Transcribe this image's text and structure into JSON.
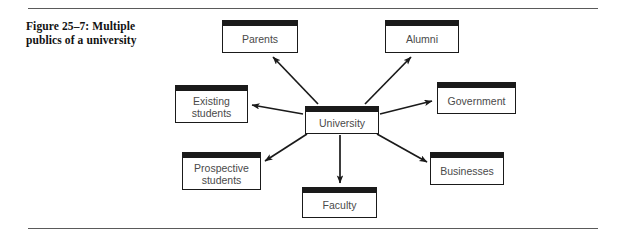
{
  "figure": {
    "caption_line1": "Figure 25–7: Multiple",
    "caption_line2": "publics of a university",
    "caption_full": "Figure 25–7: Multiple publics of a university"
  },
  "colors": {
    "box_border": "#1a1a1a",
    "box_header_bar": "#1a1a1a",
    "box_fill": "#ffffff",
    "label_text": "#4a4a4a",
    "caption_text": "#111111",
    "rule": "#5a5a5a",
    "arrow": "#1a1a1a"
  },
  "diagram": {
    "type": "hub-and-spoke",
    "center": {
      "id": "university",
      "label": "University"
    },
    "nodes": [
      {
        "id": "parents",
        "label": "Parents"
      },
      {
        "id": "alumni",
        "label": "Alumni"
      },
      {
        "id": "existing-students",
        "label": "Existing\nstudents"
      },
      {
        "id": "government",
        "label": "Government"
      },
      {
        "id": "prospective-students",
        "label": "Prospective\nstudents"
      },
      {
        "id": "businesses",
        "label": "Businesses"
      },
      {
        "id": "faculty",
        "label": "Faculty"
      }
    ],
    "edges": [
      {
        "from": "university",
        "to": "parents"
      },
      {
        "from": "university",
        "to": "alumni"
      },
      {
        "from": "university",
        "to": "existing-students"
      },
      {
        "from": "university",
        "to": "government"
      },
      {
        "from": "university",
        "to": "prospective-students"
      },
      {
        "from": "university",
        "to": "businesses"
      },
      {
        "from": "university",
        "to": "faculty"
      }
    ]
  }
}
